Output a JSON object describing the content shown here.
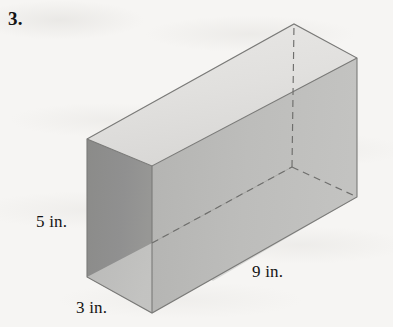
{
  "page": {
    "background_color": "#f6f5f3",
    "problem_number": "3."
  },
  "figure": {
    "name": "rectangular-prism",
    "type": "rectangular prism (open box) in oblique/isometric projection",
    "unit": "in.",
    "labels": {
      "height": "5 in.",
      "depth": "3 in.",
      "length": "9 in."
    },
    "dimensions": {
      "height_value": 5,
      "depth_value": 3,
      "length_value": 9,
      "unit": "in."
    },
    "colors": {
      "top_face": "#e2e1df",
      "left_face": "#8d8d8b",
      "front_face": "#bcbcba",
      "inner_right_face": "#a9a9a7",
      "inner_bottom_face": "#d2d2d0",
      "outline": "#6f6f6d",
      "hidden_edge": "#6a6a68",
      "text": "#141414"
    },
    "vertices": {
      "top_left_back": [
        87,
        139
      ],
      "top_left_front": [
        152,
        166
      ],
      "top_right_back": [
        294,
        24
      ],
      "top_right_front": [
        357,
        58
      ],
      "bottom_left_back": [
        87,
        277
      ],
      "bottom_left_front": [
        152,
        313
      ],
      "bottom_right_front": [
        357,
        197
      ],
      "hidden_inner_corner": [
        292,
        167
      ]
    }
  }
}
